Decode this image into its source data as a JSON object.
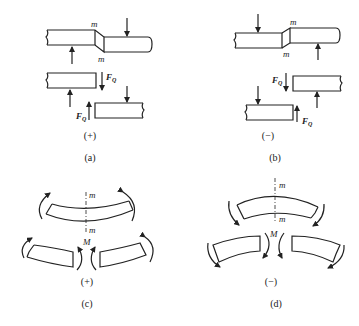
{
  "panels": {
    "a": {
      "caption": "(a)",
      "sign": "(+)",
      "section_label_top": "m",
      "section_label_bottom": "m",
      "force_label_1": "F",
      "force_sub_1": "Q",
      "force_label_2": "F",
      "force_sub_2": "Q"
    },
    "b": {
      "caption": "(b)",
      "sign": "(−)",
      "section_label_top": "m",
      "section_label_bottom": "m",
      "force_label_1": "F",
      "force_sub_1": "Q",
      "force_label_2": "F",
      "force_sub_2": "Q"
    },
    "c": {
      "caption": "(c)",
      "sign": "(+)",
      "section_label_top": "m",
      "section_label_bottom": "m",
      "moment_label": "M"
    },
    "d": {
      "caption": "(d)",
      "sign": "(−)",
      "section_label_top": "m",
      "section_label_bottom": "m",
      "moment_label": "M"
    }
  },
  "colors": {
    "ink": "#222222",
    "background": "#ffffff"
  }
}
